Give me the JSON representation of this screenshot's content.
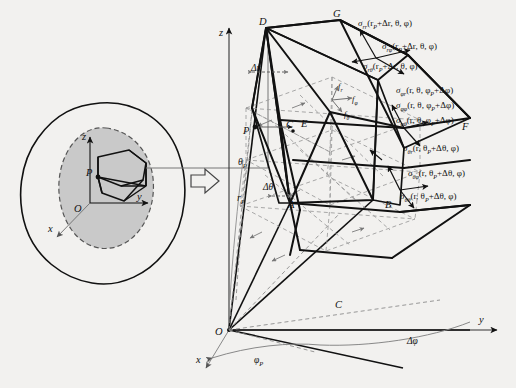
{
  "figure": {
    "type": "spherical-coordinate-stress-element-diagram",
    "background_color": "#f2f1ef",
    "line_color": "#111111",
    "dashed_color": "#8c8c8c",
    "shaded_fill": "#c9c9c9"
  },
  "left_body": {
    "name": "elastic-body-cross-section",
    "axes": {
      "x": "x",
      "y": "y",
      "z": "z",
      "origin": "O"
    },
    "point_label": "P",
    "description_shape": "irregular closed body with shaded elliptical cut plane and small wedge element at P"
  },
  "transition": {
    "arrow_glyph": "⇒",
    "name": "magnify-arrow"
  },
  "main": {
    "axes": {
      "z": "z",
      "y": "y",
      "x": "x",
      "origin": "O"
    },
    "vertices": [
      "A",
      "B",
      "C",
      "D",
      "E",
      "F",
      "G",
      "P"
    ],
    "dimension_labels": {
      "delta_r": "Δr",
      "delta_theta": "Δθ",
      "delta_phi": "Δφ",
      "r_P": "r",
      "r_P_sub": "P",
      "theta_P": "θ",
      "theta_P_sub": "P",
      "phi_P": "φ",
      "phi_P_sub": "P"
    },
    "body_forces": [
      {
        "symbol": "f",
        "sub": "r",
        "name": "body-force-r"
      },
      {
        "symbol": "f",
        "sub": "φ",
        "name": "body-force-phi"
      },
      {
        "symbol": "f",
        "sub": "θ",
        "name": "body-force-theta"
      }
    ],
    "stress_labels": {
      "r_face": [
        {
          "sigma": "σ",
          "sub": "rr",
          "args": "(r",
          "argsub": "P",
          "argrest": "+Δr, θ, φ)"
        },
        {
          "sigma": "σ",
          "sub": "rφ",
          "args": "(r",
          "argsub": "P",
          "argrest": "+Δr, θ, φ)"
        },
        {
          "sigma": "σ",
          "sub": "rθ",
          "args": "(r",
          "argsub": "P",
          "argrest": "+Δr, θ, φ)"
        }
      ],
      "phi_face": [
        {
          "sigma": "σ",
          "sub": "φr",
          "args": "(r, θ, φ",
          "argsub": "P",
          "argrest": "+Δφ)"
        },
        {
          "sigma": "σ",
          "sub": "φφ",
          "args": "(r, θ, φ",
          "argsub": "P",
          "argrest": "+Δφ)"
        },
        {
          "sigma": "σ",
          "sub": "φθ",
          "args": "(r, θ, φ",
          "argsub": "P",
          "argrest": "+Δφ)"
        }
      ],
      "theta_face": [
        {
          "sigma": "σ",
          "sub": "θr",
          "args": "(r, θ",
          "argsub": "P",
          "argrest": "+Δθ, φ)"
        },
        {
          "sigma": "σ",
          "sub": "θφ",
          "args": "(r, θ",
          "argsub": "P",
          "argrest": "+Δθ, φ)"
        },
        {
          "sigma": "σ",
          "sub": "θθ",
          "args": "(r, θ",
          "argsub": "P",
          "argrest": "+Δθ, φ)"
        }
      ]
    }
  }
}
